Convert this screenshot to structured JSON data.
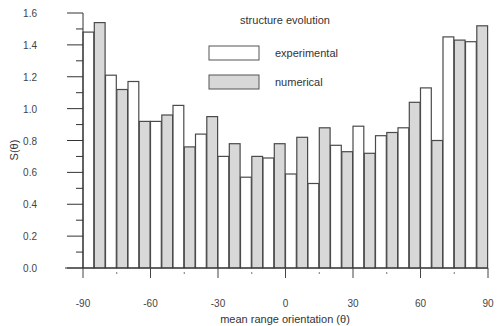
{
  "chart_data": {
    "type": "bar",
    "title": "",
    "legend_title": "structure evolution",
    "legend_placement": "top-center",
    "xlabel": "mean range orientation (θ)",
    "ylabel": "S(θ)",
    "xlim": [
      -90,
      90
    ],
    "ylim": [
      0,
      1.6
    ],
    "grid": false,
    "x_ticks": [
      -90,
      -60,
      -30,
      0,
      30,
      60,
      90
    ],
    "x_tick_labels": [
      "-90",
      "-60",
      "-30",
      "0",
      "30",
      "60",
      "90"
    ],
    "y_ticks": [
      0.0,
      0.2,
      0.4,
      0.6,
      0.8,
      1.0,
      1.2,
      1.4,
      1.6
    ],
    "y_tick_labels": [
      "0.0",
      "0.2",
      "0.4",
      "0.6",
      "0.8",
      "1.0",
      "1.2",
      "1.4",
      "1.6"
    ],
    "bin_width": 10,
    "categories": [
      -85,
      -75,
      -65,
      -55,
      -45,
      -35,
      -25,
      -15,
      -5,
      5,
      15,
      25,
      35,
      45,
      55,
      65,
      75,
      85
    ],
    "series": [
      {
        "name": "experimental",
        "color": "#ffffff",
        "values": [
          1.48,
          1.21,
          1.17,
          0.92,
          1.02,
          0.84,
          0.7,
          0.57,
          0.69,
          0.59,
          0.53,
          0.77,
          0.89,
          0.83,
          0.88,
          1.13,
          1.45,
          1.42
        ]
      },
      {
        "name": "numerical",
        "color": "#d8d8d8",
        "values": [
          1.54,
          1.12,
          0.92,
          0.96,
          0.76,
          0.95,
          0.78,
          0.7,
          0.78,
          0.82,
          0.88,
          0.73,
          0.72,
          0.85,
          1.04,
          0.8,
          1.43,
          1.52
        ]
      }
    ]
  }
}
